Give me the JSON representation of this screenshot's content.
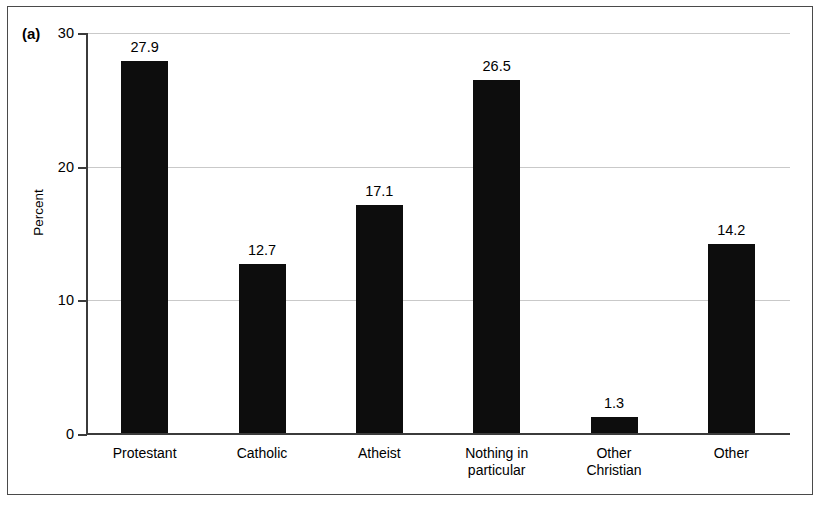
{
  "figure": {
    "panel_label": "(a)"
  },
  "chart_data": {
    "type": "bar",
    "title": "",
    "subtitle": "",
    "xlabel": "",
    "ylabel": "Percent",
    "ylim": [
      0,
      30
    ],
    "yticks": [
      0,
      10,
      20,
      30
    ],
    "ytick_labels": [
      "0",
      "10",
      "20",
      "30"
    ],
    "grid": true,
    "grid_axis": "y",
    "legend": false,
    "legend_position": "none",
    "bar_color": "#0d0d0d",
    "gridline_color": "#c9c9c9",
    "axis_color": "#3b3b3b",
    "categories": [
      "Protestant",
      "Catholic",
      "Atheist",
      "Nothing in\nparticular",
      "Other\nChristian",
      "Other"
    ],
    "values": [
      27.9,
      12.7,
      17.1,
      26.5,
      1.3,
      14.2
    ],
    "value_labels": [
      "27.9",
      "12.7",
      "17.1",
      "26.5",
      "1.3",
      "14.2"
    ]
  }
}
